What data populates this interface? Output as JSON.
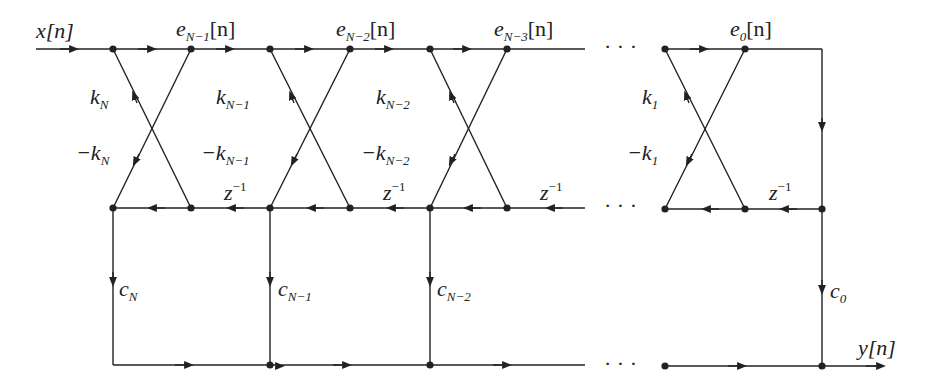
{
  "diagram": {
    "type": "lattice-filter-signal-flow-graph",
    "input_label": "x[n]",
    "output_label": "y[n]",
    "node_labels": {
      "e_N_minus_1": {
        "base": "e",
        "sub": "N−1",
        "suffix": "[n]"
      },
      "e_N_minus_2": {
        "base": "e",
        "sub": "N−2",
        "suffix": "[n]"
      },
      "e_N_minus_3": {
        "base": "e",
        "sub": "N−3",
        "suffix": "[n]"
      },
      "e_0": {
        "base": "e",
        "sub": "0",
        "suffix": "[n]"
      }
    },
    "reflection_coefficients": {
      "kN": {
        "base": "k",
        "sub": "N"
      },
      "neg_kN": {
        "base": "−k",
        "sub": "N"
      },
      "kN1": {
        "base": "k",
        "sub": "N−1"
      },
      "neg_kN1": {
        "base": "−k",
        "sub": "N−1"
      },
      "kN2": {
        "base": "k",
        "sub": "N−2"
      },
      "neg_kN2": {
        "base": "−k",
        "sub": "N−2"
      },
      "k1": {
        "base": "k",
        "sub": "1"
      },
      "neg_k1": {
        "base": "−k",
        "sub": "1"
      }
    },
    "ladder_coefficients": {
      "cN": {
        "base": "c",
        "sub": "N"
      },
      "cN1": {
        "base": "c",
        "sub": "N−1"
      },
      "cN2": {
        "base": "c",
        "sub": "N−2"
      },
      "c0": {
        "base": "c",
        "sub": "0"
      }
    },
    "delay": {
      "base": "z",
      "sup": "−1"
    },
    "ellipsis": "· · ·"
  }
}
